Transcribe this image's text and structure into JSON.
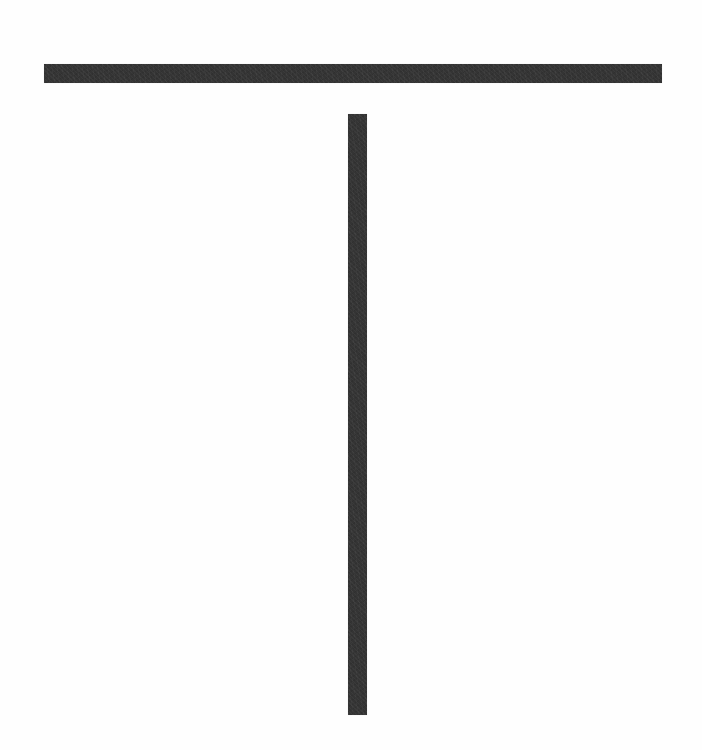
{
  "figure": {
    "colors": {
      "background": "#fefefe",
      "bar": "#343434"
    },
    "bars": [
      {
        "name": "horizontal-bar",
        "x": 44,
        "y": 64,
        "width": 618,
        "height": 19
      },
      {
        "name": "vertical-bar",
        "x": 348,
        "y": 114,
        "width": 19,
        "height": 601
      }
    ]
  }
}
